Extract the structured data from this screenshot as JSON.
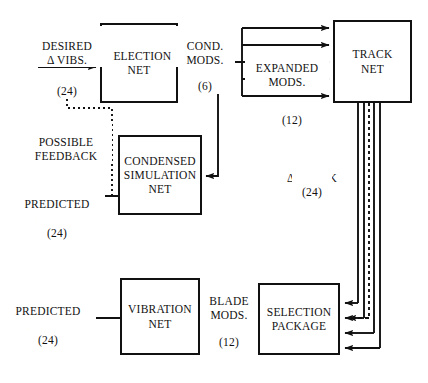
{
  "diagram": {
    "type": "block-flow-diagram",
    "nodes": [
      {
        "id": "selection-net",
        "label": "SELECTION\nNET"
      },
      {
        "id": "track-net",
        "label": "TRACK\nNET"
      },
      {
        "id": "condensed-sim-net",
        "label": "CONDENSED\nSIMULATION\nNET"
      },
      {
        "id": "vibration-net",
        "label": "VIBRATION\nNET"
      },
      {
        "id": "selection-package",
        "label": "SELECTION\nPACKAGE"
      }
    ],
    "edge_labels": [
      {
        "id": "desired-delta-vibs",
        "text": "DESIRED\nΔ VIBS.",
        "count": "(24)"
      },
      {
        "id": "cond-mods",
        "text": "COND.\nMODS.",
        "count": "(6)"
      },
      {
        "id": "expanded-mods",
        "text": "EXPANDED\nMODS.",
        "count": "(12)"
      },
      {
        "id": "possible-feedback",
        "text": "POSSIBLE\nFEEDBACK",
        "count": ""
      },
      {
        "id": "predicted-delta-vibs-top",
        "text": "PREDICTED\nΔ VIBS.",
        "count": "(24)"
      },
      {
        "id": "delta-track",
        "text": "Δ TRACK",
        "count": "(24)"
      },
      {
        "id": "blade-mods",
        "text": "BLADE\nMODS.",
        "count": "(12)"
      },
      {
        "id": "predicted-delta-vibs-bottom",
        "text": "PREDICTED\nΔ VIBS.",
        "count": "(24)"
      }
    ],
    "colors": {
      "stroke": "#111111",
      "background": "#ffffff"
    }
  }
}
